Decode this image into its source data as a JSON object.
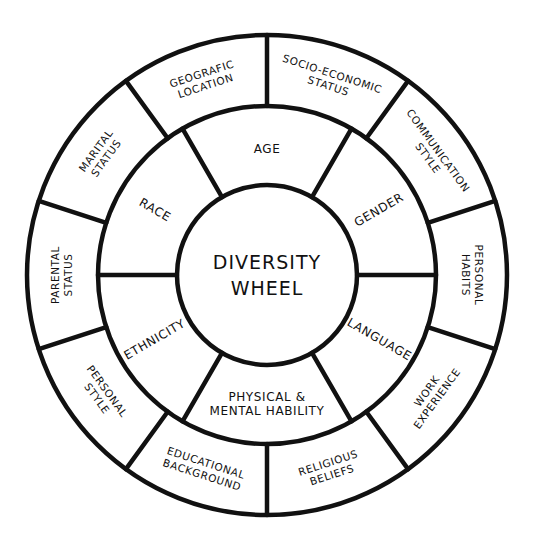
{
  "diagram": {
    "title": "Diversity Wheel",
    "center_label_lines": [
      "DIVERSITY",
      "WHEEL"
    ],
    "colors": {
      "background": "#ffffff",
      "line": "#111111",
      "text": "#111111"
    },
    "geometry": {
      "center_x": 267,
      "center_y": 275,
      "outer_radius": 240,
      "middle_radius": 169,
      "inner_radius": 90
    },
    "inner_ring": {
      "segment_count": 6,
      "divider_angles_deg": [
        30,
        90,
        150,
        210,
        270,
        330
      ],
      "segments": [
        {
          "label_lines": [
            "AGE"
          ],
          "center_angle_deg": 0,
          "orientation": "horizontal"
        },
        {
          "label_lines": [
            "GENDER"
          ],
          "center_angle_deg": 60,
          "orientation": "radial"
        },
        {
          "label_lines": [
            "LANGUAGE"
          ],
          "center_angle_deg": 120,
          "orientation": "radial"
        },
        {
          "label_lines": [
            "PHYSICAL &",
            "MENTAL HABILITY"
          ],
          "center_angle_deg": 180,
          "orientation": "horizontal"
        },
        {
          "label_lines": [
            "ETHNICITY"
          ],
          "center_angle_deg": 240,
          "orientation": "radial"
        },
        {
          "label_lines": [
            "RACE"
          ],
          "center_angle_deg": 300,
          "orientation": "radial"
        }
      ]
    },
    "outer_ring": {
      "segment_count": 10,
      "divider_angles_deg": [
        0,
        36,
        72,
        108,
        144,
        180,
        216,
        252,
        288,
        324
      ],
      "segments": [
        {
          "label_lines": [
            "SOCIO-ECONOMIC",
            "STATUS"
          ],
          "center_angle_deg": 18
        },
        {
          "label_lines": [
            "COMMUNICATION",
            "STYLE"
          ],
          "center_angle_deg": 54
        },
        {
          "label_lines": [
            "PERSONAL",
            "HABITS"
          ],
          "center_angle_deg": 90
        },
        {
          "label_lines": [
            "WORK",
            "EXPERIENCE"
          ],
          "center_angle_deg": 126
        },
        {
          "label_lines": [
            "RELIGIOUS",
            "BELIEFS"
          ],
          "center_angle_deg": 162
        },
        {
          "label_lines": [
            "EDUCATIONAL",
            "BACKGROUND"
          ],
          "center_angle_deg": 198
        },
        {
          "label_lines": [
            "PERSONAL",
            "STYLE"
          ],
          "center_angle_deg": 234
        },
        {
          "label_lines": [
            "PARENTAL",
            "STATUS"
          ],
          "center_angle_deg": 270
        },
        {
          "label_lines": [
            "MARITAL",
            "STATUS"
          ],
          "center_angle_deg": 306
        },
        {
          "label_lines": [
            "GEOGRAFIC",
            "LOCATION"
          ],
          "center_angle_deg": 342
        }
      ]
    }
  }
}
